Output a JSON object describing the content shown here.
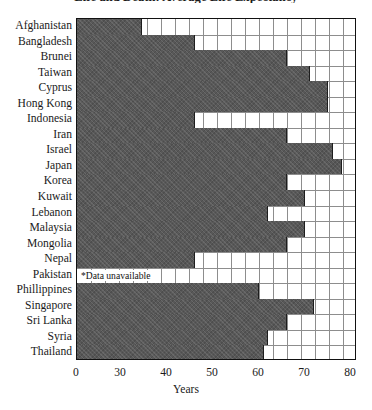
{
  "chart_data": {
    "type": "bar",
    "orientation": "horizontal",
    "title": "Life and Death:  Average Life Expectancy",
    "xlabel": "Years",
    "ylabel": "",
    "xlim": [
      0,
      80
    ],
    "xticks": [
      0,
      30,
      40,
      50,
      60,
      70,
      80
    ],
    "xtick_labels": [
      "0",
      "30",
      "40",
      "50",
      "60",
      "70",
      "80"
    ],
    "axis_break": true,
    "axis_break_note": "Axis jumps from 0 to 30; 30-80 is linearly spaced",
    "grid": true,
    "legend": "none",
    "annotation": "*Data unavailable",
    "annotation_category": "Pakistan",
    "bar_color": "#585858",
    "categories": [
      "Afghanistan",
      "Bangladesh",
      "Brunei",
      "Taiwan",
      "Cyprus",
      "Hong Kong",
      "Indonesia",
      "Iran",
      "Israel",
      "Japan",
      "Korea",
      "Kuwait",
      "Lebanon",
      "Malaysia",
      "Mongolia",
      "Nepal",
      "Pakistan",
      "Phillippines",
      "Singapore",
      "Sri Lanka",
      "Syria",
      "Thailand"
    ],
    "values": [
      34.5,
      46,
      66,
      71,
      75,
      75,
      46,
      66,
      76,
      78,
      66,
      70,
      62,
      70,
      66,
      46,
      null,
      60,
      72,
      66,
      62,
      61
    ]
  }
}
